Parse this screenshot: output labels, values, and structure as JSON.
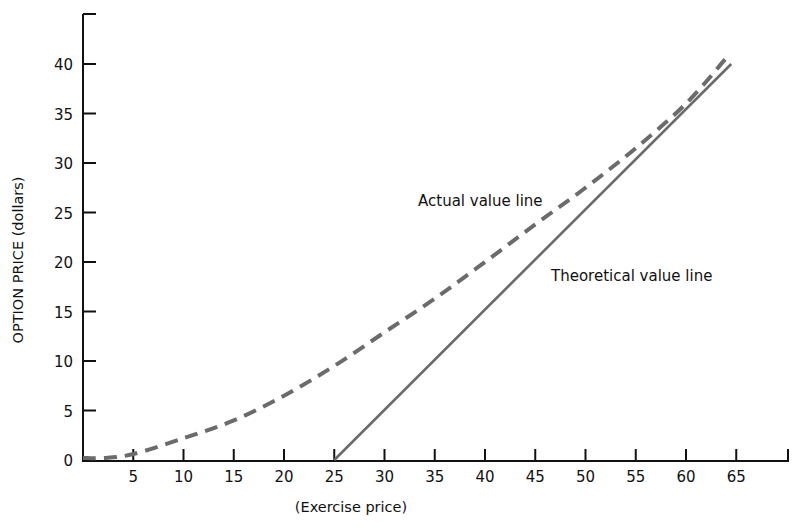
{
  "chart_data": {
    "type": "line",
    "title": "",
    "xlabel": "(Exercise price)",
    "ylabel": "OPTION PRICE (dollars)",
    "xlim": [
      0,
      70
    ],
    "ylim": [
      0,
      45
    ],
    "x_ticks": [
      5,
      10,
      15,
      20,
      25,
      30,
      35,
      40,
      45,
      50,
      55,
      60,
      65
    ],
    "y_ticks": [
      0,
      5,
      10,
      15,
      20,
      25,
      30,
      35,
      40
    ],
    "grid": false,
    "legend": "none (inline annotations)",
    "series": [
      {
        "name": "Actual value line",
        "style": "dashed",
        "color": "#6b6b6b",
        "x": [
          0,
          2,
          5,
          10,
          15,
          20,
          25,
          30,
          35,
          40,
          45,
          50,
          55,
          60,
          64
        ],
        "y": [
          0.2,
          0.2,
          0.6,
          2.2,
          4.0,
          6.5,
          9.5,
          12.9,
          16.3,
          20.0,
          23.8,
          27.5,
          31.5,
          36.0,
          40.6
        ]
      },
      {
        "name": "Theoretical value line",
        "style": "solid",
        "color": "#6b6b6b",
        "x": [
          25,
          64.5
        ],
        "y": [
          0,
          40
        ]
      }
    ],
    "annotations": [
      {
        "text": "Actual value line",
        "x": 33.5,
        "y": 26.0
      },
      {
        "text": "Theoretical value line",
        "x": 47,
        "y": 19.0
      }
    ]
  },
  "axes": {
    "x_title": "(Exercise price)",
    "y_title": "OPTION PRICE (dollars)",
    "x_tick_labels": [
      "5",
      "10",
      "15",
      "20",
      "25",
      "30",
      "35",
      "40",
      "45",
      "50",
      "55",
      "60",
      "65"
    ],
    "y_tick_labels": [
      "0",
      "5",
      "10",
      "15",
      "20",
      "25",
      "30",
      "35",
      "40"
    ]
  },
  "labels": {
    "actual": "Actual value line",
    "theoretical": "Theoretical value line"
  }
}
